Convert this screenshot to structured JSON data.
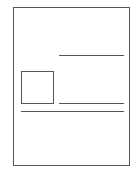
{
  "figure": {
    "kind": "page-layout-wireframe",
    "elements": [
      {
        "name": "page-outline",
        "shape": "rectangle"
      },
      {
        "name": "image-placeholder",
        "shape": "square"
      },
      {
        "name": "text-line-top",
        "shape": "line"
      },
      {
        "name": "text-line-beside-image",
        "shape": "line"
      },
      {
        "name": "text-line-full-width",
        "shape": "line"
      }
    ],
    "stroke_color": "#555555",
    "background_color": "#ffffff"
  }
}
